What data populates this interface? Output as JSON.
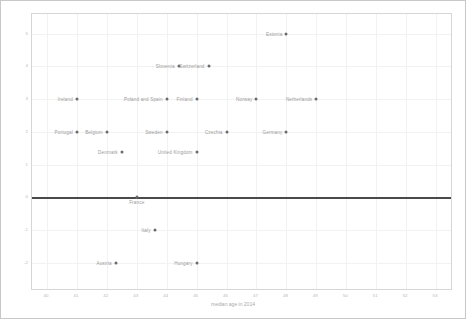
{
  "chart_data": {
    "type": "scatter",
    "title": "",
    "xlabel": "median age in 2014",
    "ylabel": "median age change in years compared to 2004",
    "xlim": [
      39.5,
      53.5
    ],
    "ylim": [
      -2.8,
      5.6
    ],
    "xticks": [
      "40",
      "41",
      "42",
      "43",
      "44",
      "45",
      "46",
      "47",
      "48",
      "49",
      "50",
      "51",
      "52",
      "53"
    ],
    "yticks": [
      "-2",
      "-1",
      "0",
      "1",
      "2",
      "3",
      "4",
      "5"
    ],
    "grid": true,
    "legend": "none",
    "reference_line": {
      "y": 0,
      "style": "solid",
      "color": "#4a4a4a"
    },
    "points": [
      {
        "label": "Estonia",
        "x": 48.0,
        "y": 5.0,
        "pos": "left"
      },
      {
        "label": "Slovenia",
        "x": 44.4,
        "y": 4.0,
        "pos": "left"
      },
      {
        "label": "Switzerland",
        "x": 45.4,
        "y": 4.0,
        "pos": "left"
      },
      {
        "label": "Ireland",
        "x": 41.0,
        "y": 3.0,
        "pos": "left"
      },
      {
        "label": "Poland and Spain",
        "x": 44.0,
        "y": 3.0,
        "pos": "left"
      },
      {
        "label": "Finland",
        "x": 45.0,
        "y": 3.0,
        "pos": "left"
      },
      {
        "label": "Norway",
        "x": 47.0,
        "y": 3.0,
        "pos": "left"
      },
      {
        "label": "Netherlands",
        "x": 49.0,
        "y": 3.0,
        "pos": "left"
      },
      {
        "label": "Portugal",
        "x": 41.0,
        "y": 2.0,
        "pos": "left"
      },
      {
        "label": "Belgium",
        "x": 42.0,
        "y": 2.0,
        "pos": "left"
      },
      {
        "label": "Sweden",
        "x": 44.0,
        "y": 2.0,
        "pos": "left"
      },
      {
        "label": "Czechia",
        "x": 46.0,
        "y": 2.0,
        "pos": "left"
      },
      {
        "label": "Germany",
        "x": 48.0,
        "y": 2.0,
        "pos": "left"
      },
      {
        "label": "Denmark",
        "x": 42.5,
        "y": 1.4,
        "pos": "left"
      },
      {
        "label": "United Kingdom",
        "x": 45.0,
        "y": 1.4,
        "pos": "left"
      },
      {
        "label": "France",
        "x": 43.0,
        "y": 0.0,
        "pos": "below"
      },
      {
        "label": "Italy",
        "x": 43.6,
        "y": -1.0,
        "pos": "left"
      },
      {
        "label": "Austria",
        "x": 42.3,
        "y": -2.0,
        "pos": "left"
      },
      {
        "label": "Hungary",
        "x": 45.0,
        "y": -2.0,
        "pos": "left"
      }
    ]
  }
}
